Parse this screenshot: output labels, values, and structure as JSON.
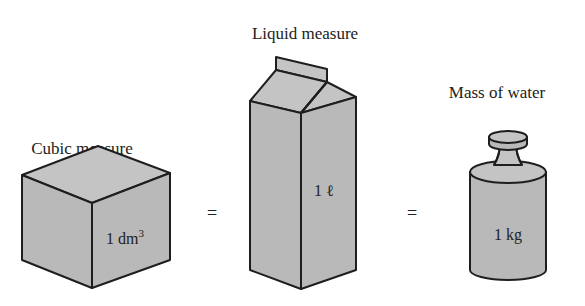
{
  "diagram": {
    "items": [
      {
        "id": "cube",
        "caption": "Cubic measure",
        "unit_value": "1 dm",
        "unit_superscript": "3",
        "shape": "cube"
      },
      {
        "id": "carton",
        "caption": "Liquid measure",
        "unit_value": "1 ℓ",
        "shape": "milk-carton"
      },
      {
        "id": "weight",
        "caption": "Mass of water",
        "unit_value": "1 kg",
        "shape": "cylinder-weight"
      }
    ],
    "operators": [
      "=",
      "="
    ],
    "colors": {
      "fill": "#b9b9b9",
      "stroke": "#1e1e1e",
      "background": "#ffffff"
    }
  }
}
